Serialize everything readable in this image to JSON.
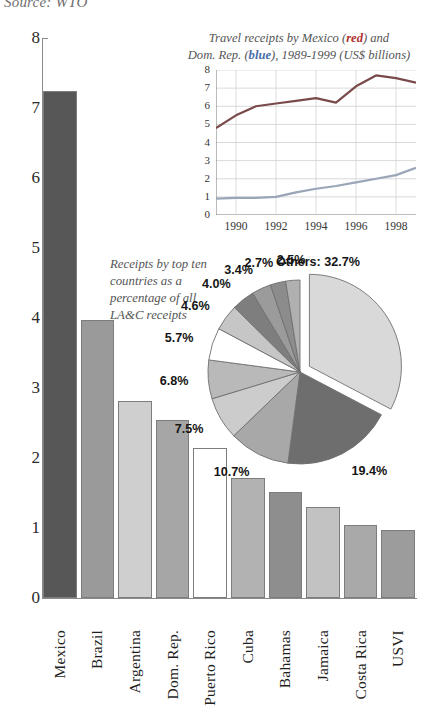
{
  "source_note": "Source: WTO",
  "chart_data": [
    {
      "type": "bar",
      "title": "",
      "xlabel": "",
      "ylabel": "",
      "ylim": [
        0,
        8
      ],
      "yticks": [
        0,
        1,
        2,
        3,
        4,
        5,
        6,
        7,
        8
      ],
      "grid": false,
      "categories": [
        "Mexico",
        "Brazil",
        "Argentina",
        "Dom. Rep.",
        "Puerto Rico",
        "Cuba",
        "Bahamas",
        "Jamaica",
        "Costa Rica",
        "USVI"
      ],
      "values": [
        7.25,
        3.97,
        2.82,
        2.55,
        2.15,
        1.72,
        1.52,
        1.3,
        1.04,
        0.97
      ],
      "bar_colors": [
        "#575757",
        "#9a9a9a",
        "#cfcfcf",
        "#a6a6a6",
        "#ffffff",
        "#b2b2b2",
        "#8e8e8e",
        "#c2c2c2",
        "#a9a9a9",
        "#9c9c9c"
      ]
    },
    {
      "type": "line",
      "title": "Travel receipts by Mexico (red) and Dom. Rep. (blue), 1989-1999 (US$ billions)",
      "title_line1_pre": "Travel receipts by Mexico (",
      "title_line1_red": "red",
      "title_line1_post": ") and",
      "title_line2_pre": "Dom. Rep. (",
      "title_line2_blue": "blue",
      "title_line2_post": "), 1989-1999 (US$ billions)",
      "xlabel": "",
      "ylabel": "",
      "ylim": [
        0,
        8
      ],
      "yticks": [
        0,
        1,
        2,
        3,
        4,
        5,
        6,
        7,
        8
      ],
      "xlim": [
        1989,
        1999
      ],
      "xticks": [
        1990,
        1992,
        1994,
        1996,
        1998
      ],
      "x": [
        1989,
        1990,
        1991,
        1992,
        1993,
        1994,
        1995,
        1996,
        1997,
        1998,
        1999
      ],
      "grid": true,
      "series": [
        {
          "name": "Mexico",
          "color": "#7a4a4a",
          "values": [
            4.8,
            5.5,
            6.0,
            6.15,
            6.3,
            6.45,
            6.2,
            7.1,
            7.7,
            7.55,
            7.3
          ]
        },
        {
          "name": "Dom. Rep.",
          "color": "#9aa6b8",
          "values": [
            0.9,
            0.95,
            0.95,
            1.0,
            1.25,
            1.45,
            1.6,
            1.8,
            2.0,
            2.2,
            2.6
          ]
        }
      ]
    },
    {
      "type": "pie",
      "title": "Receipts by top ten countries as a percentage of all LA&C receipts",
      "caption_lines": [
        "Receipts by top ten",
        "countries as a",
        "percentage of all",
        "LA&C receipts"
      ],
      "labels": [
        "Others",
        "Mexico",
        "Dom. Rep.",
        "Brazil",
        "Puerto Rico",
        "Argentina",
        "Cuba",
        "Bahamas",
        "Jamaica",
        "Costa Rica",
        "USVI"
      ],
      "values": [
        32.7,
        19.4,
        10.7,
        7.5,
        6.8,
        5.7,
        4.6,
        4.0,
        3.4,
        2.7,
        2.5
      ],
      "display_labels": [
        "Others: 32.7%",
        "19.4%",
        "10.7%",
        "7.5%",
        "6.8%",
        "5.7%",
        "4.6%",
        "4.0%",
        "3.4%",
        "2.7%",
        "2.5%"
      ],
      "slice_colors": [
        "#d9d9d9",
        "#6e6e6e",
        "#a8a8a8",
        "#cccccc",
        "#b9b9b9",
        "#ffffff",
        "#c6c6c6",
        "#7e7e7e",
        "#9b9b9b",
        "#8c8c8c",
        "#b0b0b0"
      ],
      "exploded": [
        "Others"
      ],
      "legend_position": "callout-labels"
    }
  ]
}
